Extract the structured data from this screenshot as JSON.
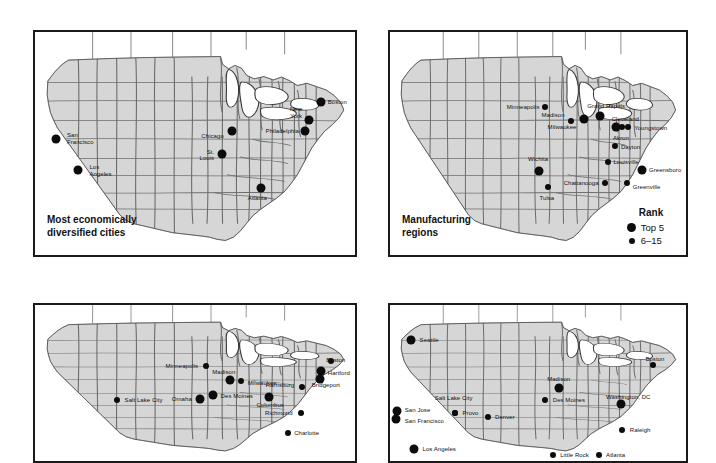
{
  "figure": {
    "panels": [
      {
        "id": "most-diversified",
        "title": "Most economically\ndiversified cities",
        "legend": null,
        "points": [
          {
            "name": "San Francisco",
            "label": "San\nFrancisco",
            "x": 6.5,
            "y": 48.0,
            "size": "big",
            "anchor": "l",
            "lx": 10.0,
            "ly": 48.0
          },
          {
            "name": "Los Angeles",
            "label": "Los\nAngeles",
            "x": 13.5,
            "y": 62.0,
            "size": "big",
            "anchor": "l",
            "lx": 17.0,
            "ly": 62.5
          },
          {
            "name": "Chicago",
            "label": "Chicago",
            "x": 61.5,
            "y": 44.5,
            "size": "big",
            "anchor": "r",
            "lx": 59.0,
            "ly": 46.5
          },
          {
            "name": "St. Louis",
            "label": "St.\nLouis",
            "x": 58.5,
            "y": 54.5,
            "size": "big",
            "anchor": "r",
            "lx": 56.0,
            "ly": 55.5
          },
          {
            "name": "Atlanta",
            "label": "Atlanta",
            "x": 70.5,
            "y": 70.0,
            "size": "big",
            "anchor": "c",
            "lx": 69.5,
            "ly": 74.5
          },
          {
            "name": "New York",
            "label": "New\nYork",
            "x": 85.5,
            "y": 39.5,
            "size": "big",
            "anchor": "r",
            "lx": 83.5,
            "ly": 36.5
          },
          {
            "name": "Philadelphia",
            "label": "Philadelphia",
            "x": 84.5,
            "y": 44.5,
            "size": "big",
            "anchor": "r",
            "lx": 82.5,
            "ly": 44.5
          },
          {
            "name": "Boston",
            "label": "Boston",
            "x": 89.5,
            "y": 31.5,
            "size": "big",
            "anchor": "l",
            "lx": 91.5,
            "ly": 31.5
          }
        ]
      },
      {
        "id": "manufacturing",
        "title": "Manufacturing\nregions",
        "legend": {
          "title": "Rank",
          "items": [
            {
              "label": "Top 5",
              "size": "big"
            },
            {
              "label": "6–15",
              "size": "sm"
            }
          ]
        },
        "points": [
          {
            "name": "Minneapolis",
            "label": "Minneapolis",
            "x": 52.5,
            "y": 33.5,
            "size": "sm",
            "anchor": "r",
            "lx": 50.5,
            "ly": 33.5
          },
          {
            "name": "Madison",
            "label": "Madison",
            "x": 61.0,
            "y": 40.0,
            "size": "sm",
            "anchor": "r",
            "lx": 59.0,
            "ly": 37.0
          },
          {
            "name": "Milwaukee",
            "label": "Milwaukee",
            "x": 65.5,
            "y": 39.0,
            "size": "big",
            "anchor": "r",
            "lx": 63.0,
            "ly": 42.5
          },
          {
            "name": "Grand Rapids",
            "label": "Grand Rapids",
            "x": 71.0,
            "y": 37.5,
            "size": "big",
            "anchor": "c",
            "lx": 73.0,
            "ly": 33.0
          },
          {
            "name": "Cleveland",
            "label": "Cleveland",
            "x": 76.5,
            "y": 42.5,
            "size": "big",
            "anchor": "c",
            "lx": 79.5,
            "ly": 39.0
          },
          {
            "name": "Youngstown",
            "label": "Youngstown",
            "x": 80.5,
            "y": 42.5,
            "size": "sm",
            "anchor": "l",
            "lx": 82.5,
            "ly": 43.0
          },
          {
            "name": "Akron",
            "label": "Akron",
            "x": 78.5,
            "y": 42.5,
            "size": "sm",
            "anchor": "c",
            "lx": 78.0,
            "ly": 47.5
          },
          {
            "name": "Dayton",
            "label": "Dayton",
            "x": 76.0,
            "y": 51.0,
            "size": "sm",
            "anchor": "l",
            "lx": 78.0,
            "ly": 51.5
          },
          {
            "name": "Louisville",
            "label": "Louisville",
            "x": 73.5,
            "y": 58.5,
            "size": "sm",
            "anchor": "l",
            "lx": 75.5,
            "ly": 58.5
          },
          {
            "name": "Wichita",
            "label": "Wichita",
            "x": 50.5,
            "y": 62.5,
            "size": "big",
            "anchor": "c",
            "lx": 50.0,
            "ly": 57.0
          },
          {
            "name": "Tulsa",
            "label": "Tulsa",
            "x": 53.5,
            "y": 69.5,
            "size": "sm",
            "anchor": "c",
            "lx": 53.0,
            "ly": 74.5
          },
          {
            "name": "Chattanooga",
            "label": "Chattanooga",
            "x": 72.5,
            "y": 67.5,
            "size": "sm",
            "anchor": "r",
            "lx": 70.5,
            "ly": 67.5
          },
          {
            "name": "Greensboro",
            "label": "Greensboro",
            "x": 85.0,
            "y": 62.0,
            "size": "big",
            "anchor": "l",
            "lx": 87.5,
            "ly": 62.0
          },
          {
            "name": "Greenville",
            "label": "Greenville",
            "x": 80.0,
            "y": 67.5,
            "size": "sm",
            "anchor": "l",
            "lx": 82.0,
            "ly": 69.5
          }
        ]
      },
      {
        "id": "best-performing-mid",
        "title": "",
        "legend": null,
        "points": [
          {
            "name": "Salt Lake City",
            "label": "Salt Lake City",
            "x": 25.5,
            "y": 61.0,
            "size": "sm",
            "anchor": "l",
            "lx": 28.0,
            "ly": 61.0
          },
          {
            "name": "Minneapolis",
            "label": "Minneapolis",
            "x": 53.5,
            "y": 39.0,
            "size": "sm",
            "anchor": "r",
            "lx": 51.0,
            "ly": 39.0
          },
          {
            "name": "Madison",
            "label": "Madison",
            "x": 61.0,
            "y": 48.0,
            "size": "big",
            "anchor": "c",
            "lx": 59.0,
            "ly": 43.0
          },
          {
            "name": "Milwaukee",
            "label": "Milwaukee",
            "x": 64.5,
            "y": 48.5,
            "size": "sm",
            "anchor": "l",
            "lx": 66.5,
            "ly": 50.0
          },
          {
            "name": "Omaha",
            "label": "Omaha",
            "x": 51.5,
            "y": 60.0,
            "size": "big",
            "anchor": "r",
            "lx": 49.0,
            "ly": 60.0
          },
          {
            "name": "Des Moines",
            "label": "Des Moines",
            "x": 55.5,
            "y": 58.0,
            "size": "big",
            "anchor": "l",
            "lx": 58.0,
            "ly": 58.5
          },
          {
            "name": "Columbus",
            "label": "Columbus",
            "x": 73.0,
            "y": 59.0,
            "size": "big",
            "anchor": "c",
            "lx": 73.5,
            "ly": 64.0
          },
          {
            "name": "Harrisburg",
            "label": "Harrisburg",
            "x": 83.5,
            "y": 52.5,
            "size": "sm",
            "anchor": "r",
            "lx": 81.0,
            "ly": 51.0
          },
          {
            "name": "Richmond",
            "label": "Richmond",
            "x": 83.0,
            "y": 69.0,
            "size": "sm",
            "anchor": "r",
            "lx": 80.5,
            "ly": 69.0
          },
          {
            "name": "Charlotte",
            "label": "Charlotte",
            "x": 79.0,
            "y": 82.0,
            "size": "sm",
            "anchor": "l",
            "lx": 81.0,
            "ly": 82.0
          },
          {
            "name": "Bridgeport",
            "label": "Bridgeport",
            "x": 89.0,
            "y": 47.5,
            "size": "big",
            "anchor": "l",
            "lx": 86.5,
            "ly": 51.5
          },
          {
            "name": "Hartford",
            "label": "Hartford",
            "x": 89.5,
            "y": 42.5,
            "size": "big",
            "anchor": "l",
            "lx": 91.5,
            "ly": 43.5
          },
          {
            "name": "Boston",
            "label": "Boston",
            "x": 92.5,
            "y": 36.0,
            "size": "sm",
            "anchor": "l",
            "lx": 91.0,
            "ly": 35.0
          }
        ]
      },
      {
        "id": "fastest-growing",
        "title": "",
        "legend": null,
        "points": [
          {
            "name": "Seattle",
            "label": "Seattle",
            "x": 7.0,
            "y": 22.5,
            "size": "big",
            "anchor": "l",
            "lx": 10.0,
            "ly": 22.5
          },
          {
            "name": "San Jose",
            "label": "San Jose",
            "x": 2.5,
            "y": 68.0,
            "size": "big",
            "anchor": "l",
            "lx": 5.0,
            "ly": 67.5
          },
          {
            "name": "San Francisco",
            "label": "San Francisco",
            "x": 2.0,
            "y": 73.0,
            "size": "big",
            "anchor": "l",
            "lx": 5.0,
            "ly": 74.5
          },
          {
            "name": "Los Angeles",
            "label": "Los Angeles",
            "x": 8.0,
            "y": 92.0,
            "size": "big",
            "anchor": "l",
            "lx": 11.0,
            "ly": 92.0
          },
          {
            "name": "Salt Lake City",
            "label": "Salt Lake City",
            "x": 22.0,
            "y": 69.0,
            "size": "sm",
            "anchor": "c",
            "lx": 21.5,
            "ly": 59.5
          },
          {
            "name": "Provo",
            "label": "Provo",
            "x": 22.0,
            "y": 69.0,
            "size": "sm",
            "anchor": "l",
            "lx": 24.5,
            "ly": 69.0
          },
          {
            "name": "Denver",
            "label": "Denver",
            "x": 33.0,
            "y": 72.0,
            "size": "sm",
            "anchor": "l",
            "lx": 35.5,
            "ly": 72.0
          },
          {
            "name": "Madison",
            "label": "Madison",
            "x": 57.0,
            "y": 53.0,
            "size": "big",
            "anchor": "c",
            "lx": 57.0,
            "ly": 47.5
          },
          {
            "name": "Des Moines",
            "label": "Des Moines",
            "x": 52.5,
            "y": 61.0,
            "size": "sm",
            "anchor": "l",
            "lx": 55.0,
            "ly": 61.0
          },
          {
            "name": "Little Rock",
            "label": "Little Rock",
            "x": 55.0,
            "y": 96.0,
            "size": "sm",
            "anchor": "l",
            "lx": 57.5,
            "ly": 96.0
          },
          {
            "name": "Atlanta",
            "label": "Atlanta",
            "x": 70.5,
            "y": 96.0,
            "size": "sm",
            "anchor": "l",
            "lx": 73.0,
            "ly": 96.0
          },
          {
            "name": "Raleigh",
            "label": "Raleigh",
            "x": 78.5,
            "y": 80.0,
            "size": "sm",
            "anchor": "l",
            "lx": 81.0,
            "ly": 80.0
          },
          {
            "name": "Washington, DC",
            "label": "Washington, DC",
            "x": 78.0,
            "y": 63.5,
            "size": "big",
            "anchor": "c",
            "lx": 80.5,
            "ly": 59.0
          },
          {
            "name": "Boston",
            "label": "Boston",
            "x": 89.0,
            "y": 38.5,
            "size": "sm",
            "anchor": "c",
            "lx": 89.5,
            "ly": 34.5
          }
        ]
      }
    ]
  },
  "style": {
    "land_fill": "#d6d6d6",
    "border_stroke": "#6e6e6e",
    "outline_stroke": "#3a3a3a",
    "dot_color": "#0c0c0c",
    "panel_border": "#1a1a1a"
  }
}
